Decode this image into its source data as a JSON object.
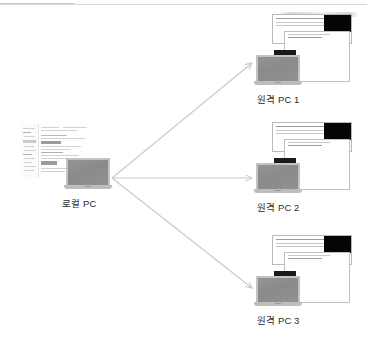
{
  "figure": {
    "type": "network-topology-diagram",
    "background_color": "#ffffff",
    "accent_color": "#c4c4c8",
    "arrow_color": "#c9c9cd",
    "laptop_screen_color": "#8d8d8d",
    "laptop_bezel_color": "#c3c3c3"
  },
  "nodes": {
    "local": {
      "label": "로컬 PC",
      "role": "source",
      "icon": "laptop-icon",
      "screenshot": "ide-window-screenshot"
    },
    "remotes": [
      {
        "label": "원격 PC 1",
        "role": "target",
        "icon": "laptop-icon",
        "windows": 2
      },
      {
        "label": "원격 PC 2",
        "role": "target",
        "icon": "laptop-icon",
        "windows": 2
      },
      {
        "label": "원격 PC 3",
        "role": "target",
        "icon": "laptop-icon",
        "windows": 2
      }
    ]
  },
  "connections": [
    {
      "from": "로컬 PC",
      "to": "원격 PC 1",
      "style": "arrow"
    },
    {
      "from": "로컬 PC",
      "to": "원격 PC 2",
      "style": "arrow"
    },
    {
      "from": "로컬 PC",
      "to": "원격 PC 3",
      "style": "arrow"
    }
  ]
}
